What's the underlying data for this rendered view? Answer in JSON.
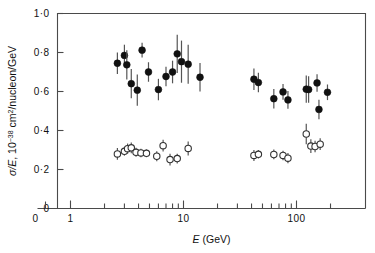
{
  "chart_data": {
    "type": "scatter",
    "title": "",
    "xlabel": "E (GeV)",
    "ylabel": "σ/E, 10⁻³⁸ cm²/nucleon/GeV",
    "xscale": "log",
    "yscale": "linear",
    "xlim": [
      2.0,
      250
    ],
    "ylim": [
      0,
      1.0
    ],
    "grid": false,
    "legend_position": "none",
    "x_tick_labels": [
      "0",
      "1",
      "10",
      "100"
    ],
    "y_tick_labels": [
      "0",
      "0·2",
      "0·4",
      "0·6",
      "0·8",
      "1·0"
    ],
    "y_tick_values": [
      0,
      0.2,
      0.4,
      0.6,
      0.8,
      1.0
    ],
    "x_major_ticks": [
      1,
      10,
      100
    ],
    "x_minor_ticks": [
      2,
      3,
      4,
      5,
      6,
      7,
      8,
      9,
      20,
      30,
      40,
      50,
      60,
      70,
      80,
      90,
      200
    ],
    "series": [
      {
        "name": "neutrino",
        "marker": "filled-circle",
        "color": "#111111",
        "points": [
          {
            "x": 2.6,
            "y": 0.745,
            "yerr": 0.055
          },
          {
            "x": 3.0,
            "y": 0.785,
            "yerr": 0.055
          },
          {
            "x": 3.15,
            "y": 0.737,
            "yerr": 0.075
          },
          {
            "x": 3.45,
            "y": 0.64,
            "yerr": 0.075
          },
          {
            "x": 3.9,
            "y": 0.607,
            "yerr": 0.08
          },
          {
            "x": 4.3,
            "y": 0.812,
            "yerr": 0.038
          },
          {
            "x": 4.9,
            "y": 0.7,
            "yerr": 0.05
          },
          {
            "x": 6.0,
            "y": 0.61,
            "yerr": 0.055
          },
          {
            "x": 7.0,
            "y": 0.677,
            "yerr": 0.05
          },
          {
            "x": 8.0,
            "y": 0.7,
            "yerr": 0.058
          },
          {
            "x": 8.8,
            "y": 0.793,
            "yerr": 0.098
          },
          {
            "x": 9.6,
            "y": 0.753,
            "yerr": 0.108
          },
          {
            "x": 11.0,
            "y": 0.74,
            "yerr": 0.1
          },
          {
            "x": 14.0,
            "y": 0.673,
            "yerr": 0.073
          },
          {
            "x": 42.0,
            "y": 0.663,
            "yerr": 0.055
          },
          {
            "x": 46.0,
            "y": 0.646,
            "yerr": 0.05
          },
          {
            "x": 63.0,
            "y": 0.563,
            "yerr": 0.05
          },
          {
            "x": 76.0,
            "y": 0.598,
            "yerr": 0.04
          },
          {
            "x": 84.0,
            "y": 0.557,
            "yerr": 0.045
          },
          {
            "x": 122.0,
            "y": 0.612,
            "yerr": 0.07
          },
          {
            "x": 128.0,
            "y": 0.61,
            "yerr": 0.068
          },
          {
            "x": 152.0,
            "y": 0.644,
            "yerr": 0.045
          },
          {
            "x": 158.0,
            "y": 0.508,
            "yerr": 0.05
          },
          {
            "x": 188.0,
            "y": 0.596,
            "yerr": 0.04
          }
        ]
      },
      {
        "name": "antineutrino",
        "marker": "open-circle",
        "color": "#333333",
        "points": [
          {
            "x": 2.6,
            "y": 0.28,
            "yerr": 0.03
          },
          {
            "x": 3.0,
            "y": 0.293,
            "yerr": 0.022
          },
          {
            "x": 3.2,
            "y": 0.307,
            "yerr": 0.026
          },
          {
            "x": 3.45,
            "y": 0.311,
            "yerr": 0.028
          },
          {
            "x": 3.8,
            "y": 0.288,
            "yerr": 0.023
          },
          {
            "x": 4.2,
            "y": 0.285,
            "yerr": 0.022
          },
          {
            "x": 4.7,
            "y": 0.283,
            "yerr": 0.02
          },
          {
            "x": 5.8,
            "y": 0.268,
            "yerr": 0.026
          },
          {
            "x": 6.6,
            "y": 0.322,
            "yerr": 0.03
          },
          {
            "x": 7.6,
            "y": 0.251,
            "yerr": 0.03
          },
          {
            "x": 8.8,
            "y": 0.256,
            "yerr": 0.025
          },
          {
            "x": 11.0,
            "y": 0.308,
            "yerr": 0.036
          },
          {
            "x": 42.0,
            "y": 0.272,
            "yerr": 0.028
          },
          {
            "x": 46.0,
            "y": 0.278,
            "yerr": 0.022
          },
          {
            "x": 63.0,
            "y": 0.277,
            "yerr": 0.025
          },
          {
            "x": 76.0,
            "y": 0.272,
            "yerr": 0.024
          },
          {
            "x": 84.0,
            "y": 0.258,
            "yerr": 0.026
          },
          {
            "x": 122.0,
            "y": 0.382,
            "yerr": 0.052
          },
          {
            "x": 134.0,
            "y": 0.32,
            "yerr": 0.035
          },
          {
            "x": 146.0,
            "y": 0.318,
            "yerr": 0.03
          },
          {
            "x": 162.0,
            "y": 0.33,
            "yerr": 0.03
          }
        ]
      }
    ]
  },
  "axes": {
    "y_label_text": "σ/E, 10",
    "y_label_sup": "−38",
    "y_label_rest": " cm",
    "y_label_sup2": "2",
    "y_label_rest2": "/nucleon/GeV",
    "x_label_italic": "E",
    "x_label_rest": " (GeV)"
  }
}
